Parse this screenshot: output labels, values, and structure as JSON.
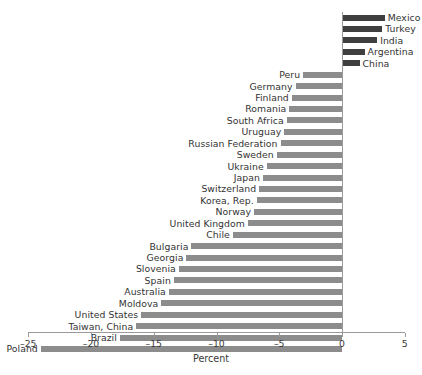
{
  "chart_data": {
    "type": "bar",
    "orientation": "horizontal",
    "title": "",
    "xlabel": "Percent",
    "ylabel": "",
    "xlim": [
      -25,
      5
    ],
    "xticks": [
      -25,
      -20,
      -15,
      -10,
      -5,
      0,
      5
    ],
    "xticklabels": [
      "–25",
      "–20",
      "–15",
      "–10",
      "–5",
      "0",
      "5"
    ],
    "grid": false,
    "legend": null,
    "colors": {
      "negative_bar": "#8c8c8c",
      "positive_bar": "#3f3f3f",
      "axis": "#9a9a9a",
      "text": "#333333",
      "background": "#ffffff"
    },
    "categories": [
      "Mexico",
      "Turkey",
      "India",
      "Argentina",
      "China",
      "Peru",
      "Germany",
      "Finland",
      "Romania",
      "South Africa",
      "Uruguay",
      "Russian Federation",
      "Sweden",
      "Ukraine",
      "Japan",
      "Switzerland",
      "Korea, Rep.",
      "Norway",
      "United Kingdom",
      "Chile",
      "Bulgaria",
      "Georgia",
      "Slovenia",
      "Spain",
      "Australia",
      "Moldova",
      "United States",
      "Taiwan, China",
      "Brazil",
      "Poland"
    ],
    "values": [
      3.4,
      3.2,
      2.8,
      1.8,
      1.4,
      -3.1,
      -3.7,
      -4.0,
      -4.2,
      -4.4,
      -4.6,
      -4.9,
      -5.2,
      -6.0,
      -6.3,
      -6.6,
      -6.8,
      -7.0,
      -7.5,
      -8.7,
      -12.0,
      -12.4,
      -13.0,
      -13.4,
      -13.8,
      -14.4,
      -16.0,
      -16.4,
      -17.7,
      -24.0
    ]
  }
}
